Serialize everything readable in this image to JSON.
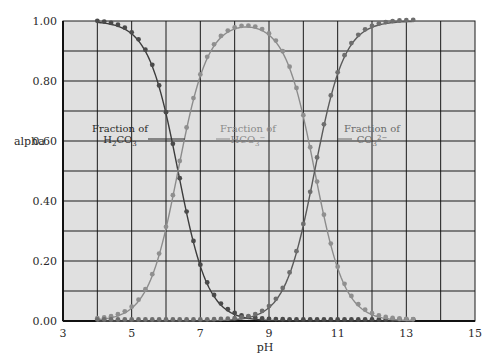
{
  "chart_data": {
    "type": "line",
    "title": "",
    "xlabel": "pH",
    "ylabel": "alpha",
    "xlim": [
      3,
      15
    ],
    "ylim": [
      0,
      1
    ],
    "xticks": [
      "3",
      "5",
      "7",
      "9",
      "11",
      "13",
      "15"
    ],
    "xtick_values": [
      3,
      5,
      7,
      9,
      11,
      13,
      15
    ],
    "yticks": [
      "0.00",
      "0.20",
      "0.40",
      "0.60",
      "0.80",
      "1.00"
    ],
    "ytick_values": [
      0,
      0.2,
      0.4,
      0.6,
      0.8,
      1.0
    ],
    "grid": true,
    "grid_x_step": 1,
    "grid_y_step": 0.1,
    "x_start": 4.0,
    "x_end": 13.2,
    "x_step": 0.2,
    "pKa1": 6.35,
    "pKa2": 10.33,
    "series": [
      {
        "name": "Fraction of H2CO3",
        "color": "#3c3c3c",
        "marker_color": "#4a4a4a"
      },
      {
        "name": "Fraction of HCO3-",
        "color": "#8c8c8c",
        "marker_color": "#8f8f8f"
      },
      {
        "name": "Fraction of CO3 2-",
        "color": "#5a5a5a",
        "marker_color": "#6e6e6e"
      }
    ],
    "annotations": [
      {
        "line1": "Fraction of",
        "line2_base": "H",
        "line2_sub": "2",
        "line2_rest": "CO",
        "line2_sub2": "3",
        "line2_sup": "",
        "color": "#2a2a2a",
        "pointer_to_ph": 6.6,
        "at_alpha": 0.63
      },
      {
        "line1": "Fraction of",
        "line2_base": "HCO",
        "line2_sub": "",
        "line2_rest": "",
        "line2_sub2": "3",
        "line2_sup": "−",
        "color": "#8a8a8a",
        "pointer_to_ph": 5.9,
        "at_alpha": 0.63
      },
      {
        "line1": "Fraction of",
        "line2_base": "CO",
        "line2_sub": "",
        "line2_rest": "",
        "line2_sub2": "3",
        "line2_sup": "2−",
        "color": "#6a6a6a",
        "pointer_to_ph": 10.7,
        "at_alpha": 0.63
      }
    ],
    "colors": {
      "plot_background": "#e0e0e0",
      "grid": "#1a1a1a",
      "axis": "#111111"
    }
  }
}
